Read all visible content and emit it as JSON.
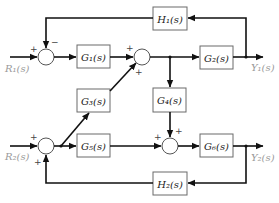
{
  "diagram": {
    "type": "block-diagram",
    "inputs": [
      {
        "id": "R1",
        "label": "R₁(s)"
      },
      {
        "id": "R2",
        "label": "R₂(s)"
      }
    ],
    "outputs": [
      {
        "id": "Y1",
        "label": "Y₁(s)"
      },
      {
        "id": "Y2",
        "label": "Y₂(s)"
      }
    ],
    "blocks": {
      "G1": "G₁(s)",
      "G2": "G₂(s)",
      "G3": "G₃(s)",
      "G4": "G₄(s)",
      "G5": "G₅(s)",
      "G6": "G₆(s)",
      "H1": "H₁(s)",
      "H2": "H₂(s)"
    },
    "summing_junctions": [
      {
        "id": "S1",
        "signs": {
          "left": "+",
          "top": "−"
        }
      },
      {
        "id": "S2",
        "signs": {
          "left": "+",
          "bottom": "+"
        }
      },
      {
        "id": "S3",
        "signs": {
          "left": "+",
          "bottom": "+"
        }
      },
      {
        "id": "S4",
        "signs": {
          "left": "+",
          "top": "+"
        }
      }
    ],
    "connections": [
      "R1 → S1(+)",
      "S1 → G1",
      "G1 → S2(+)",
      "G3 → S2(+)",
      "S2 → G2",
      "S2 output → G4",
      "G2 → Y1",
      "Y1 → H1 → S1(−)",
      "R2 → S3(+)",
      "S3 → G5",
      "S3 output → G3",
      "G5 → S4(+)",
      "G4 → S4(+)",
      "S4 → G6",
      "G6 → Y2",
      "Y2 → H2 → S3(+)"
    ]
  }
}
